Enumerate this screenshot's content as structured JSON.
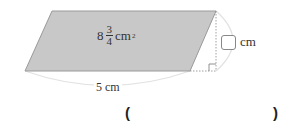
{
  "diagram": {
    "shape": "parallelogram",
    "fill_color": "#c8c8c8",
    "stroke_color": "#9a9a9a",
    "area": {
      "whole": "8",
      "numerator": "3",
      "denominator": "4",
      "unit": "cm",
      "unit_exponent": "2"
    },
    "base": {
      "label": "5 cm"
    },
    "height": {
      "answer_box": "",
      "unit": "cm"
    },
    "right_angle_marker": true
  },
  "answer": {
    "open_paren": "(",
    "close_paren": ")",
    "value": ""
  }
}
